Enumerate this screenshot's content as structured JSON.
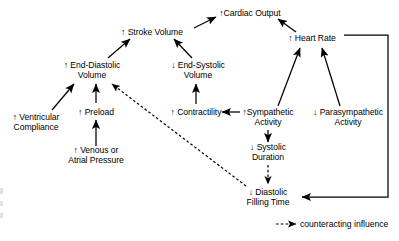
{
  "diagram": {
    "nodes": [
      {
        "id": "cardiac_output",
        "label": "↑Cardiac Output",
        "x": 250,
        "y": 13,
        "lines": [
          "↑Cardiac Output"
        ]
      },
      {
        "id": "stroke_volume",
        "label": "↑ Stroke Volume",
        "x": 152,
        "y": 32,
        "lines": [
          "↑ Stroke Volume"
        ]
      },
      {
        "id": "heart_rate",
        "label": "↑ Heart Rate",
        "x": 312,
        "y": 38,
        "lines": [
          "↑ Heart Rate"
        ]
      },
      {
        "id": "end_diastolic",
        "label": "↑ End-Diastolic Volume",
        "x": 92,
        "y": 70,
        "lines": [
          "↑ End-Diastolic",
          "Volume"
        ]
      },
      {
        "id": "end_systolic",
        "label": "↓ End-Systolic Volume",
        "x": 198,
        "y": 70,
        "lines": [
          "↓ End-Systolic",
          "Volume"
        ]
      },
      {
        "id": "ventricular_compl",
        "label": "↑ Ventricular Compliance",
        "x": 36,
        "y": 122,
        "lines": [
          "↑ Ventricular",
          "Compliance"
        ]
      },
      {
        "id": "preload",
        "label": "↑ Preload",
        "x": 96,
        "y": 112,
        "lines": [
          "↑ Preload"
        ]
      },
      {
        "id": "contractility",
        "label": "↑ Contractility",
        "x": 196,
        "y": 112,
        "lines": [
          "↑ Contractility"
        ]
      },
      {
        "id": "sympathetic",
        "label": "↑Sympathetic Activity",
        "x": 268,
        "y": 117,
        "lines": [
          "↑Sympathetic",
          "Activity"
        ]
      },
      {
        "id": "parasympathetic",
        "label": "↓ Parasympathetic Activity",
        "x": 348,
        "y": 117,
        "lines": [
          "↓ Parasympathetic",
          "Activity"
        ]
      },
      {
        "id": "venous_pressure",
        "label": "↑ Venous or Atrial Pressure",
        "x": 96,
        "y": 155,
        "lines": [
          "↑ Venous or",
          "Atrial Pressure"
        ]
      },
      {
        "id": "systolic_duration",
        "label": "↓ Systolic Duration",
        "x": 268,
        "y": 152,
        "lines": [
          "↓ Systolic",
          "Duration"
        ]
      },
      {
        "id": "diastolic_filling",
        "label": "↓ Diastolic Filling Time",
        "x": 268,
        "y": 197,
        "lines": [
          "↓ Diastolic",
          "Filling Time"
        ]
      }
    ],
    "legend": {
      "lines": [
        "counteracting",
        "influence"
      ],
      "marker": "dashed-arrow",
      "x": 345,
      "y": 228
    },
    "colors": {
      "stroke": "#000000",
      "background": "#ffffff",
      "text": "#000000"
    }
  }
}
